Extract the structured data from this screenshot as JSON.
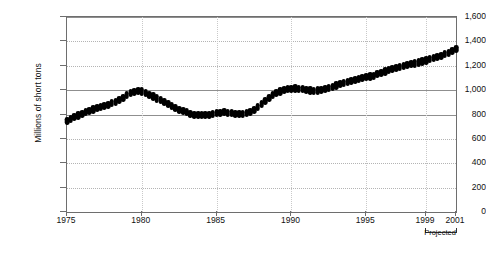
{
  "chart_data": {
    "type": "line",
    "marker_style": "filled-diamond",
    "title": "",
    "subtitle": "",
    "xlabel": "",
    "ylabel": "Millions of short tons",
    "ylim": [
      0,
      1600
    ],
    "xlim": [
      1975,
      2001
    ],
    "ytick_values": [
      0,
      200,
      400,
      600,
      800,
      1000,
      1200,
      1400,
      1600
    ],
    "ytick_labels": [
      "0",
      "200",
      "400",
      "600",
      "800",
      "1,000",
      "1,200",
      "1,400",
      "1,600"
    ],
    "xtick_values": [
      1975,
      1980,
      1985,
      1990,
      1995,
      1999,
      2001
    ],
    "xtick_labels": [
      "1975",
      "1980",
      "1985",
      "1990",
      "1995",
      "1999",
      "2001"
    ],
    "grid": "horizontal-dotted",
    "legend": "none",
    "legend_position": "none",
    "annotations": [
      {
        "text": "Projected",
        "type": "bracket",
        "x_start": 1999,
        "x_end": 2001
      }
    ],
    "series": [
      {
        "name": "Coal consumption",
        "x": [
          1975.0,
          1975.25,
          1975.5,
          1975.75,
          1976.0,
          1976.25,
          1976.5,
          1976.75,
          1977.0,
          1977.25,
          1977.5,
          1977.75,
          1978.0,
          1978.25,
          1978.5,
          1978.75,
          1979.0,
          1979.25,
          1979.5,
          1979.75,
          1980.0,
          1980.25,
          1980.5,
          1980.75,
          1981.0,
          1981.25,
          1981.5,
          1981.75,
          1982.0,
          1982.25,
          1982.5,
          1982.75,
          1983.0,
          1983.25,
          1983.5,
          1983.75,
          1984.0,
          1984.25,
          1984.5,
          1984.75,
          1985.0,
          1985.25,
          1985.5,
          1985.75,
          1986.0,
          1986.25,
          1986.5,
          1986.75,
          1987.0,
          1987.25,
          1987.5,
          1987.75,
          1988.0,
          1988.25,
          1988.5,
          1988.75,
          1989.0,
          1989.25,
          1989.5,
          1989.75,
          1990.0,
          1990.25,
          1990.5,
          1990.75,
          1991.0,
          1991.25,
          1991.5,
          1991.75,
          1992.0,
          1992.25,
          1992.5,
          1992.75,
          1993.0,
          1993.25,
          1993.5,
          1993.75,
          1994.0,
          1994.25,
          1994.5,
          1994.75,
          1995.0,
          1995.25,
          1995.5,
          1995.75,
          1996.0,
          1996.25,
          1996.5,
          1996.75,
          1997.0,
          1997.25,
          1997.5,
          1997.75,
          1998.0,
          1998.25,
          1998.5,
          1998.75,
          1999.0,
          1999.25,
          1999.5,
          1999.75,
          2000.0,
          2000.25,
          2000.5,
          2000.75,
          2001.0
        ],
        "values": [
          748,
          762,
          778,
          792,
          806,
          818,
          830,
          842,
          852,
          862,
          872,
          882,
          892,
          906,
          920,
          938,
          958,
          975,
          988,
          995,
          990,
          978,
          962,
          948,
          932,
          918,
          902,
          888,
          872,
          856,
          840,
          828,
          818,
          808,
          800,
          796,
          794,
          796,
          800,
          806,
          812,
          816,
          818,
          816,
          810,
          806,
          804,
          806,
          812,
          824,
          840,
          860,
          885,
          912,
          938,
          958,
          975,
          990,
          1000,
          1008,
          1012,
          1014,
          1012,
          1008,
          1002,
          998,
          996,
          998,
          1002,
          1008,
          1016,
          1026,
          1038,
          1050,
          1060,
          1068,
          1076,
          1084,
          1092,
          1100,
          1106,
          1112,
          1120,
          1130,
          1142,
          1154,
          1164,
          1172,
          1180,
          1188,
          1196,
          1204,
          1212,
          1220,
          1228,
          1236,
          1244,
          1254,
          1264,
          1274,
          1284,
          1296,
          1308,
          1320,
          1338
        ]
      }
    ]
  }
}
